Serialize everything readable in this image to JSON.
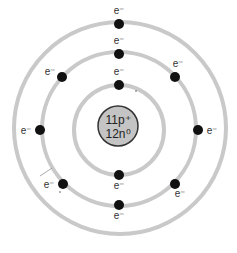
{
  "diagram": {
    "nucleus": {
      "line1": "11p⁺",
      "line2": "12n⁰",
      "fill": "#c4c4c4",
      "stroke": "#333333"
    },
    "ring_color": "#c9c9c9",
    "electron_color": "#111111",
    "electron_label": "e⁻",
    "shells": [
      {
        "name": "shell-1",
        "electrons": 2
      },
      {
        "name": "shell-2",
        "electrons": 8
      },
      {
        "name": "shell-3",
        "electrons": 1
      }
    ]
  },
  "labels": {
    "e_outer_top": "e⁻",
    "e_mid_top": "e⁻",
    "e_inner_top": "e⁻",
    "e_mid_tl": "e⁻",
    "e_mid_tr": "e⁻",
    "e_mid_left": "e⁻",
    "e_mid_right": "e⁻",
    "e_mid_bl": "e⁻",
    "e_mid_br": "e⁻",
    "e_inner_bottom": "e⁻",
    "e_mid_bottom": "e⁻"
  }
}
